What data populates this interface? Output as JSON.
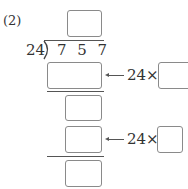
{
  "problem": {
    "label": "(2)",
    "divisor": "24",
    "dividend": "7 5 7",
    "steps": [
      {
        "multiplier_text": "24×"
      },
      {
        "multiplier_text": "24×"
      }
    ]
  }
}
